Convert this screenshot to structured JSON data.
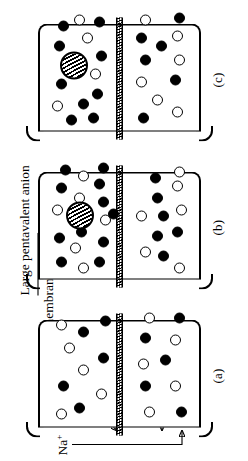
{
  "figure": {
    "orientation": "rotated-90-ccw",
    "ink_color": "#000000",
    "background_color": "#ffffff"
  },
  "annotations": {
    "sodium": {
      "text": "Na",
      "charge": "+",
      "full": "Na+"
    },
    "chloride": {
      "text": "Cl",
      "charge": "−",
      "full": "Cl−"
    },
    "membrane": {
      "text": "Permeable membrane"
    },
    "large_anion": {
      "text": "Large pentavalent anion"
    }
  },
  "panels": [
    {
      "id": "a",
      "caption": "(a)",
      "has_large_anion": false
    },
    {
      "id": "b",
      "caption": "(b)",
      "has_large_anion": true
    },
    {
      "id": "c",
      "caption": "(c)",
      "has_large_anion": true
    }
  ],
  "legend": {
    "cation_symbol": "filled-circle",
    "anion_symbol": "open-circle",
    "large_anion_symbol": "hatched-circle",
    "membrane_symbol": "hatched-band"
  },
  "chart_data": {
    "type": "diagram",
    "panels": [
      {
        "id": "a",
        "caption": "(a)",
        "upper_compartment": {
          "cations": 5,
          "anions": 5,
          "large_anions": 0
        },
        "lower_compartment": {
          "cations": 5,
          "anions": 5,
          "large_anions": 0
        },
        "note": "Equal distribution of Na+ and Cl− on both sides"
      },
      {
        "id": "b",
        "caption": "(b)",
        "upper_compartment": {
          "cations": 11,
          "anions": 6,
          "large_anions": 1
        },
        "lower_compartment": {
          "cations": 6,
          "anions": 6,
          "large_anions": 0
        },
        "note": "Large pentavalent anion added to upper compartment"
      },
      {
        "id": "c",
        "caption": "(c)",
        "upper_compartment": {
          "cations": 10,
          "anions": 4,
          "large_anions": 1
        },
        "lower_compartment": {
          "cations": 6,
          "anions": 7,
          "large_anions": 0
        },
        "note": "Equilibrium redistribution of diffusible ions"
      }
    ]
  },
  "ion_layout": {
    "panel_a_upper": [
      {
        "type": "cation",
        "x": 34,
        "y": 10
      },
      {
        "type": "anion",
        "x": 72,
        "y": 16
      },
      {
        "type": "cation",
        "x": 12,
        "y": 26
      },
      {
        "type": "anion",
        "x": 50,
        "y": 30
      },
      {
        "type": "cation",
        "x": 88,
        "y": 30
      },
      {
        "type": "anion",
        "x": 95,
        "y": 8
      },
      {
        "type": "anion",
        "x": 26,
        "y": 48
      },
      {
        "type": "cation",
        "x": 62,
        "y": 50
      },
      {
        "type": "anion",
        "x": 6,
        "y": 8
      },
      {
        "type": "cation",
        "x": 99,
        "y": 52
      }
    ],
    "panel_a_lower": [
      {
        "type": "anion",
        "x": 8,
        "y": 96
      },
      {
        "type": "cation",
        "x": 34,
        "y": 92
      },
      {
        "type": "anion",
        "x": 56,
        "y": 90
      },
      {
        "type": "cation",
        "x": 82,
        "y": 92
      },
      {
        "type": "anion",
        "x": 102,
        "y": 96
      },
      {
        "type": "cation",
        "x": 60,
        "y": 112
      },
      {
        "type": "anion",
        "x": 34,
        "y": 122
      },
      {
        "type": "anion",
        "x": 80,
        "y": 122
      },
      {
        "type": "cation",
        "x": 8,
        "y": 128
      },
      {
        "type": "cation",
        "x": 102,
        "y": 126
      }
    ],
    "panel_b_upper": [
      {
        "type": "cation",
        "x": 10,
        "y": 8
      },
      {
        "type": "cation",
        "x": 34,
        "y": 6
      },
      {
        "type": "anion",
        "x": 24,
        "y": 22
      },
      {
        "type": "anion",
        "x": 62,
        "y": 4
      },
      {
        "type": "cation",
        "x": 84,
        "y": 8
      },
      {
        "type": "cation",
        "x": 102,
        "y": 12
      },
      {
        "type": "anion",
        "x": 4,
        "y": 30
      },
      {
        "type": "cation",
        "x": 40,
        "y": 28
      },
      {
        "type": "anion",
        "x": 96,
        "y": 30
      },
      {
        "type": "cation",
        "x": 10,
        "y": 46
      },
      {
        "type": "cation",
        "x": 30,
        "y": 50
      },
      {
        "type": "anion",
        "x": 52,
        "y": 52
      },
      {
        "type": "cation",
        "x": 70,
        "y": 50
      },
      {
        "type": "cation",
        "x": 88,
        "y": 46
      },
      {
        "type": "cation",
        "x": 104,
        "y": 50
      },
      {
        "type": "anion",
        "x": 74,
        "y": 26
      },
      {
        "type": "cation",
        "x": 58,
        "y": 60
      }
    ],
    "panel_b_lower": [
      {
        "type": "anion",
        "x": 20,
        "y": 92
      },
      {
        "type": "anion",
        "x": 56,
        "y": 88
      },
      {
        "type": "cation",
        "x": 36,
        "y": 104
      },
      {
        "type": "cation",
        "x": 16,
        "y": 110
      },
      {
        "type": "cation",
        "x": 74,
        "y": 104
      },
      {
        "type": "cation",
        "x": 94,
        "y": 102
      },
      {
        "type": "anion",
        "x": 4,
        "y": 126
      },
      {
        "type": "cation",
        "x": 40,
        "y": 124
      },
      {
        "type": "anion",
        "x": 62,
        "y": 128
      },
      {
        "type": "anion",
        "x": 100,
        "y": 126
      },
      {
        "type": "cation",
        "x": 56,
        "y": 110
      },
      {
        "type": "anion",
        "x": 86,
        "y": 124
      }
    ],
    "panel_c_upper": [
      {
        "type": "anion",
        "x": 18,
        "y": 4
      },
      {
        "type": "cation",
        "x": 40,
        "y": 8
      },
      {
        "type": "cation",
        "x": 4,
        "y": 18
      },
      {
        "type": "cation",
        "x": 78,
        "y": 6
      },
      {
        "type": "cation",
        "x": 98,
        "y": 10
      },
      {
        "type": "cation",
        "x": 20,
        "y": 30
      },
      {
        "type": "anion",
        "x": 104,
        "y": 26
      },
      {
        "type": "cation",
        "x": 6,
        "y": 40
      },
      {
        "type": "cation",
        "x": 30,
        "y": 44
      },
      {
        "type": "anion",
        "x": 50,
        "y": 42
      },
      {
        "type": "anion",
        "x": 86,
        "y": 34
      },
      {
        "type": "cation",
        "x": 68,
        "y": 48
      },
      {
        "type": "cation",
        "x": 102,
        "y": 46
      }
    ],
    "panel_c_lower": [
      {
        "type": "cation",
        "x": 6,
        "y": 90
      },
      {
        "type": "anion",
        "x": 42,
        "y": 88
      },
      {
        "type": "cation",
        "x": 64,
        "y": 92
      },
      {
        "type": "cation",
        "x": 86,
        "y": 88
      },
      {
        "type": "anion",
        "x": 104,
        "y": 92
      },
      {
        "type": "anion",
        "x": 24,
        "y": 104
      },
      {
        "type": "cation",
        "x": 78,
        "y": 108
      },
      {
        "type": "anion",
        "x": 12,
        "y": 124
      },
      {
        "type": "cation",
        "x": 44,
        "y": 122
      },
      {
        "type": "anion",
        "x": 64,
        "y": 126
      },
      {
        "type": "anion",
        "x": 88,
        "y": 124
      },
      {
        "type": "cation",
        "x": 106,
        "y": 126
      }
    ],
    "large_anion_positions": {
      "panel_b": {
        "x": 48,
        "y": 18
      },
      "panel_c": {
        "x": 50,
        "y": 12
      }
    }
  }
}
